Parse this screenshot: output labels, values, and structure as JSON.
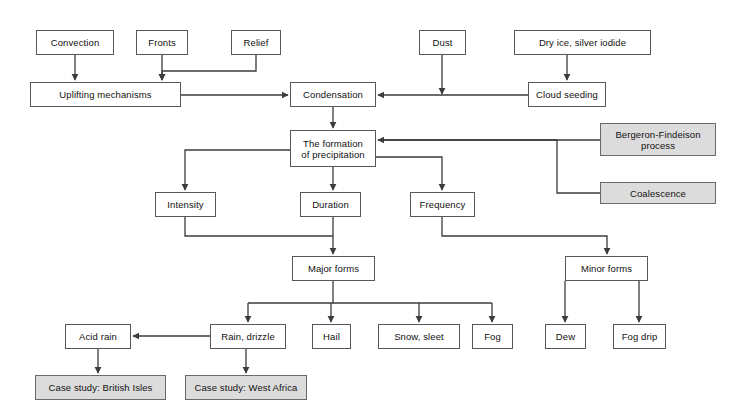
{
  "diagram": {
    "colors": {
      "box_fill": "#ffffff",
      "box_shaded_fill": "#dcdcdc",
      "box_border": "#58585a",
      "connector": "#3b3b3d",
      "text": "#111111",
      "background": "#ffffff"
    },
    "nodes": [
      {
        "id": "convection",
        "label": "Convection",
        "x": 36,
        "y": 30,
        "w": 78,
        "h": 25,
        "shaded": false
      },
      {
        "id": "fronts",
        "label": "Fronts",
        "x": 136,
        "y": 30,
        "w": 52,
        "h": 25,
        "shaded": false
      },
      {
        "id": "relief",
        "label": "Relief",
        "x": 231,
        "y": 30,
        "w": 50,
        "h": 25,
        "shaded": false
      },
      {
        "id": "dust",
        "label": "Dust",
        "x": 419,
        "y": 30,
        "w": 47,
        "h": 25,
        "shaded": false
      },
      {
        "id": "dry-ice",
        "label": "Dry ice, silver iodide",
        "x": 514,
        "y": 30,
        "w": 137,
        "h": 25,
        "shaded": false
      },
      {
        "id": "uplifting",
        "label": "Uplifting mechanisms",
        "x": 30,
        "y": 82,
        "w": 151,
        "h": 25,
        "shaded": false
      },
      {
        "id": "condensation",
        "label": "Condensation",
        "x": 290,
        "y": 82,
        "w": 86,
        "h": 25,
        "shaded": false
      },
      {
        "id": "cloud-seed",
        "label": "Cloud seeding",
        "x": 528,
        "y": 82,
        "w": 78,
        "h": 25,
        "shaded": false
      },
      {
        "id": "formation",
        "label": "The formation\nof precipitation",
        "x": 290,
        "y": 130,
        "w": 86,
        "h": 37,
        "shaded": false
      },
      {
        "id": "bergeron",
        "label": "Bergeron-Findeison\nprocess",
        "x": 600,
        "y": 123,
        "w": 116,
        "h": 33,
        "shaded": true
      },
      {
        "id": "coalescence",
        "label": "Coalescence",
        "x": 600,
        "y": 182,
        "w": 116,
        "h": 22,
        "shaded": true
      },
      {
        "id": "intensity",
        "label": "Intensity",
        "x": 155,
        "y": 192,
        "w": 61,
        "h": 25,
        "shaded": false
      },
      {
        "id": "duration",
        "label": "Duration",
        "x": 300,
        "y": 192,
        "w": 61,
        "h": 25,
        "shaded": false
      },
      {
        "id": "frequency",
        "label": "Frequency",
        "x": 410,
        "y": 192,
        "w": 65,
        "h": 25,
        "shaded": false
      },
      {
        "id": "major-forms",
        "label": "Major forms",
        "x": 292,
        "y": 256,
        "w": 83,
        "h": 25,
        "shaded": false
      },
      {
        "id": "minor-forms",
        "label": "Minor forms",
        "x": 565,
        "y": 256,
        "w": 83,
        "h": 25,
        "shaded": false
      },
      {
        "id": "acid-rain",
        "label": "Acid rain",
        "x": 65,
        "y": 324,
        "w": 66,
        "h": 25,
        "shaded": false
      },
      {
        "id": "rain-drizzle",
        "label": "Rain, drizzle",
        "x": 210,
        "y": 324,
        "w": 76,
        "h": 25,
        "shaded": false
      },
      {
        "id": "hail",
        "label": "Hail",
        "x": 312,
        "y": 324,
        "w": 39,
        "h": 25,
        "shaded": false
      },
      {
        "id": "snow-sleet",
        "label": "Snow, sleet",
        "x": 378,
        "y": 324,
        "w": 82,
        "h": 25,
        "shaded": false
      },
      {
        "id": "fog",
        "label": "Fog",
        "x": 472,
        "y": 324,
        "w": 41,
        "h": 25,
        "shaded": false
      },
      {
        "id": "dew",
        "label": "Dew",
        "x": 545,
        "y": 324,
        "w": 41,
        "h": 25,
        "shaded": false
      },
      {
        "id": "fog-drip",
        "label": "Fog drip",
        "x": 613,
        "y": 324,
        "w": 53,
        "h": 25,
        "shaded": false
      },
      {
        "id": "case-british",
        "label": "Case study: British Isles",
        "x": 35,
        "y": 375,
        "w": 131,
        "h": 25,
        "shaded": true
      },
      {
        "id": "case-africa",
        "label": "Case study: West Africa",
        "x": 185,
        "y": 375,
        "w": 122,
        "h": 25,
        "shaded": true
      }
    ],
    "edges": [
      {
        "from": "convection",
        "to": "uplifting"
      },
      {
        "from": "fronts",
        "to": "uplifting"
      },
      {
        "from": "relief",
        "to": "uplifting"
      },
      {
        "from": "uplifting",
        "to": "condensation"
      },
      {
        "from": "dust",
        "to": "condensation"
      },
      {
        "from": "dry-ice",
        "to": "cloud-seed"
      },
      {
        "from": "cloud-seed",
        "to": "condensation"
      },
      {
        "from": "condensation",
        "to": "formation"
      },
      {
        "from": "bergeron",
        "to": "formation"
      },
      {
        "from": "coalescence",
        "to": "formation"
      },
      {
        "from": "formation",
        "to": "intensity"
      },
      {
        "from": "formation",
        "to": "duration"
      },
      {
        "from": "formation",
        "to": "frequency"
      },
      {
        "from": "intensity",
        "to": "major-forms"
      },
      {
        "from": "duration",
        "to": "major-forms"
      },
      {
        "from": "frequency",
        "to": "minor-forms"
      },
      {
        "from": "major-forms",
        "to": "rain-drizzle"
      },
      {
        "from": "major-forms",
        "to": "hail"
      },
      {
        "from": "major-forms",
        "to": "snow-sleet"
      },
      {
        "from": "major-forms",
        "to": "fog"
      },
      {
        "from": "minor-forms",
        "to": "dew"
      },
      {
        "from": "minor-forms",
        "to": "fog-drip"
      },
      {
        "from": "rain-drizzle",
        "to": "acid-rain"
      },
      {
        "from": "acid-rain",
        "to": "case-british"
      },
      {
        "from": "rain-drizzle",
        "to": "case-africa"
      }
    ]
  }
}
